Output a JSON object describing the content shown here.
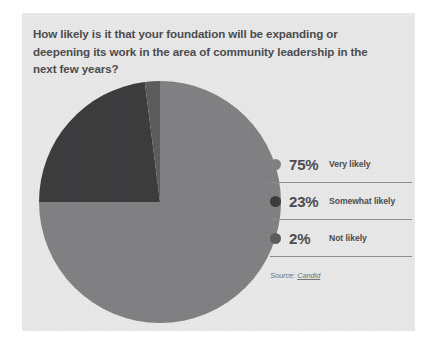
{
  "card": {
    "background_color": "#e9e9e9"
  },
  "title": "How likely is it that your foundation will be expanding or deepening its work in the area of community leadership in the next few years?",
  "legend": {
    "rows": [
      {
        "percent": "75%",
        "label": "Very likely",
        "color": "#808083"
      },
      {
        "percent": "23%",
        "label": "Somewhat likely",
        "color": "#3a3a3c"
      },
      {
        "percent": "2%",
        "label": "Not likely",
        "color": "#5a5a5c"
      }
    ]
  },
  "source": {
    "prefix": "Source: ",
    "link_text": "Candid"
  },
  "chart_data": {
    "type": "pie",
    "title": "How likely is it that your foundation will be expanding or deepening its work in the area of community leadership in the next few years?",
    "categories": [
      "Very likely",
      "Somewhat likely",
      "Not likely"
    ],
    "values": [
      75,
      23,
      2
    ],
    "value_labels": [
      "75%",
      "23%",
      "2%"
    ],
    "colors": [
      "#808083",
      "#3a3a3c",
      "#5a5a5c"
    ],
    "units": "percent",
    "start_angle_deg": 0,
    "direction": "clockwise",
    "legend_position": "right",
    "grid": false,
    "xlabel": "",
    "ylabel": "",
    "source": "Candid"
  }
}
